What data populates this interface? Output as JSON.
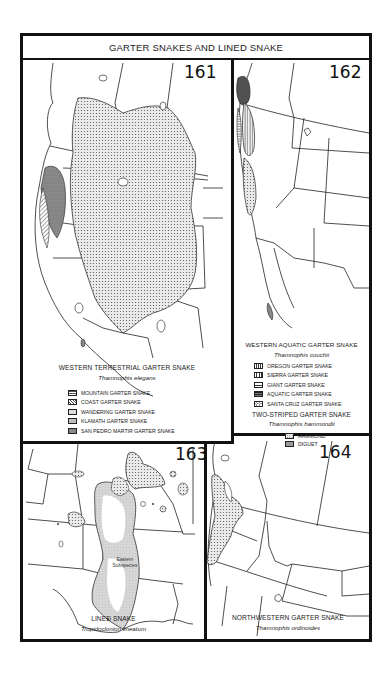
{
  "page": {
    "title": "GARTER SNAKES AND LINED SNAKE"
  },
  "maps": [
    {
      "number": "161",
      "common_name": "WESTERN TERRESTRIAL GARTER SNAKE",
      "scientific_name": "Thamnophis elegans",
      "legend": [
        {
          "label": "MOUNTAIN GARTER SNAKE",
          "pattern": "grid-dots"
        },
        {
          "label": "COAST GARTER SNAKE",
          "pattern": "diagonal"
        },
        {
          "label": "WANDERING GARTER SNAKE",
          "pattern": "fine-dots"
        },
        {
          "label": "KLAMATH GARTER SNAKE",
          "pattern": "light-stipple"
        },
        {
          "label": "SAN PEDRO MARTIR GARTER SNAKE",
          "pattern": "dense-stipple"
        }
      ]
    },
    {
      "number": "162",
      "common_name": "WESTERN AQUATIC GARTER SNAKE",
      "scientific_name": "Thamnophis couchii",
      "legend": [
        {
          "label": "OREGON GARTER SNAKE",
          "pattern": "vertical-dense"
        },
        {
          "label": "SIERRA GARTER SNAKE",
          "pattern": "vertical"
        },
        {
          "label": "GIANT GARTER SNAKE",
          "pattern": "horizontal"
        },
        {
          "label": "AQUATIC GARTER SNAKE",
          "pattern": "dark-horizontal"
        },
        {
          "label": "SANTA CRUZ GARTER SNAKE",
          "pattern": "circles"
        }
      ],
      "secondary": {
        "common_name": "TWO-STRIPED GARTER SNAKE",
        "scientific_name": "Thamnophis hammondii",
        "legend": [
          {
            "label": "HAMMOND",
            "pattern": "cross-dots"
          },
          {
            "label": "DIGUET",
            "pattern": "dense-dots"
          }
        ]
      }
    },
    {
      "number": "163",
      "common_name": "LINED SNAKE",
      "scientific_name": "Tropidoclonion lineatum",
      "annotation": "Eastern Subspecies"
    },
    {
      "number": "164",
      "common_name": "NORTHWESTERN GARTER SNAKE",
      "scientific_name": "Thamnophis ordinoides"
    }
  ],
  "colors": {
    "border": "#111111",
    "stipple": "#c8c8c8",
    "dark_fill": "#7a7a7a",
    "background": "#ffffff"
  }
}
